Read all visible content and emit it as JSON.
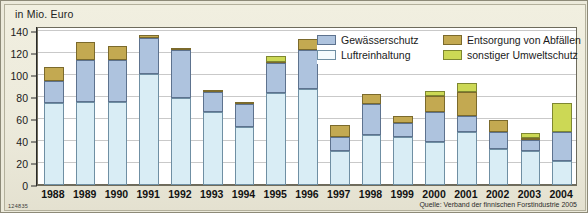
{
  "unit_label": "in Mio. Euro",
  "source": "Quelle: Verband der finnischen Forstindustrie 2005",
  "figure_id": "124835",
  "legend": [
    {
      "key": "gewae",
      "label": "Gewässerschutz"
    },
    {
      "key": "luft",
      "label": "Luftreinhaltung"
    },
    {
      "key": "entsor",
      "label": "Entsorgung von Abfällen"
    },
    {
      "key": "sonst",
      "label": "sonstiger Umweltschutz"
    }
  ],
  "colors": {
    "luftreinhaltung": "#d9edf5",
    "gewaesserschutz": "#aec3de",
    "entsorgung": "#c3a951",
    "sonstiger": "#ccd855",
    "background": "#eceadb",
    "plot_background": "#ffffff",
    "grid": "#c9c9c9"
  },
  "chart_data": {
    "type": "bar",
    "stacked": true,
    "title": "",
    "subtitle": "",
    "xlabel": "",
    "ylabel": "in Mio. Euro",
    "ylim": [
      0,
      145
    ],
    "yticks": [
      0,
      20,
      40,
      60,
      80,
      100,
      120,
      140
    ],
    "grid": true,
    "legend_position": "top-right",
    "categories": [
      "1988",
      "1989",
      "1990",
      "1991",
      "1992",
      "1993",
      "1994",
      "1995",
      "1996",
      "1997",
      "1998",
      "1999",
      "2000",
      "2001",
      "2002",
      "2003",
      "2004"
    ],
    "series": [
      {
        "name": "Luftreinhaltung",
        "key": "luft",
        "color": "#d9edf5",
        "values": [
          75,
          76,
          76,
          101,
          79,
          67,
          53,
          84,
          88,
          31,
          46,
          44,
          39,
          48,
          33,
          31,
          22
        ]
      },
      {
        "name": "Gewässerschutz",
        "key": "gewae",
        "color": "#aec3de",
        "values": [
          20,
          38,
          38,
          33,
          44,
          18,
          21,
          27,
          35,
          13,
          28,
          13,
          28,
          15,
          15,
          10,
          26
        ]
      },
      {
        "name": "Entsorgung von Abfällen",
        "key": "entsor",
        "color": "#c3a951",
        "values": [
          13,
          16,
          13,
          3,
          1,
          2,
          2,
          1,
          10,
          11,
          9,
          6,
          14,
          22,
          11,
          2,
          0
        ]
      },
      {
        "name": "sonstiger Umweltschutz",
        "key": "sonst",
        "color": "#ccd855",
        "values": [
          0,
          0,
          0,
          0,
          0,
          0,
          0,
          6,
          0,
          0,
          0,
          0,
          5,
          8,
          0,
          4,
          27
        ]
      }
    ],
    "totals": [
      108,
      130,
      127,
      137,
      124,
      87,
      76,
      118,
      133,
      55,
      83,
      63,
      86,
      93,
      59,
      47,
      75
    ]
  }
}
